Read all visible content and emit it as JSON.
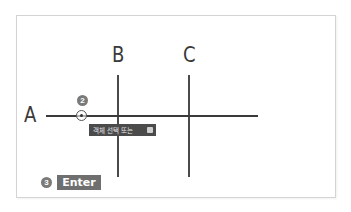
{
  "diagram": {
    "labels": {
      "a": "A",
      "b": "B",
      "c": "C"
    },
    "step_badges": {
      "step2": "2",
      "step3": "3"
    },
    "tooltip": {
      "text": "객체 선택 또는",
      "icon": "keyboard-icon"
    },
    "enter_key": {
      "label": "Enter"
    },
    "colors": {
      "line": "#3a3a3a",
      "badge": "#7a7a7a",
      "tooltip_bg": "#4b4b4b",
      "enter_bg": "#6f6f6f",
      "frame_border": "#d4d4d4"
    }
  }
}
